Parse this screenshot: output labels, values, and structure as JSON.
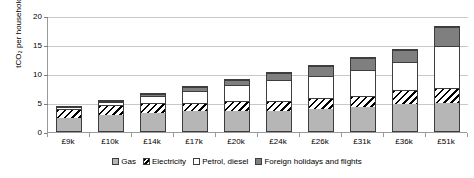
{
  "chart_data": {
    "type": "bar",
    "stacked": true,
    "title": "",
    "xlabel": "",
    "ylabel": "tCO2 per household",
    "ylabel_display": "tCO₂ per household",
    "ylim": [
      0,
      20
    ],
    "yticks": [
      "0",
      "5",
      "10",
      "15",
      "20"
    ],
    "ytick_values": [
      0,
      5,
      10,
      15,
      20
    ],
    "grid": true,
    "legend_position": "bottom",
    "categories": [
      "£9k",
      "£10k",
      "£14k",
      "£17k",
      "£20k",
      "£24k",
      "£26k",
      "£31k",
      "£36k",
      "£51k"
    ],
    "series": [
      {
        "name": "Gas",
        "color": "#b6b6b6",
        "pattern": "solid-light-gray",
        "values": [
          2.4,
          3.0,
          3.2,
          3.6,
          3.6,
          3.6,
          4.0,
          4.3,
          4.8,
          5.0
        ]
      },
      {
        "name": "Electricity",
        "color": "#000000",
        "pattern": "diagonal-hatch",
        "values": [
          1.7,
          1.7,
          1.8,
          1.5,
          1.7,
          1.7,
          1.8,
          1.9,
          2.4,
          2.6
        ]
      },
      {
        "name": "Petrol, diesel",
        "color": "#ffffff",
        "pattern": "solid-white",
        "values": [
          0.4,
          0.7,
          1.3,
          2.1,
          3.0,
          3.8,
          4.0,
          4.6,
          5.0,
          7.4
        ]
      },
      {
        "name": "Foreign holidays and flights",
        "color": "#7f7f7f",
        "pattern": "solid-dark-gray",
        "values": [
          0.0,
          0.2,
          0.5,
          0.7,
          0.9,
          1.3,
          1.8,
          2.2,
          2.1,
          3.2
        ]
      }
    ],
    "totals": [
      4.5,
      5.6,
      6.8,
      7.9,
      9.2,
      10.4,
      11.6,
      13.0,
      14.3,
      18.2
    ]
  },
  "legend": {
    "items": [
      {
        "label": "Gas"
      },
      {
        "label": "Electricity"
      },
      {
        "label": "Petrol, diesel"
      },
      {
        "label": "Foreign holidays and flights"
      }
    ]
  }
}
